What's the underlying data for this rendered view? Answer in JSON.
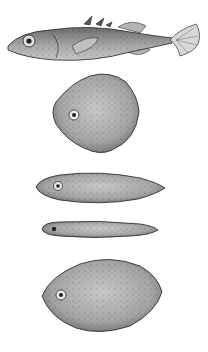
{
  "figure": {
    "background_color": "#ffffff",
    "body_fill": "#9a9a9a",
    "body_light": "#c4c4c4",
    "outline_color": "#2a2a2a",
    "items": [
      {
        "name": "stickleback-fish",
        "shape": "realistic fish",
        "y_center": 40
      },
      {
        "name": "model-rhomboid",
        "shape": "rounded rhombus",
        "y_center": 118
      },
      {
        "name": "model-elongate",
        "shape": "elongated oval",
        "y_center": 187
      },
      {
        "name": "model-slender",
        "shape": "thin elongated oval",
        "y_center": 229
      },
      {
        "name": "model-oval",
        "shape": "broad oval",
        "y_center": 296
      }
    ]
  }
}
